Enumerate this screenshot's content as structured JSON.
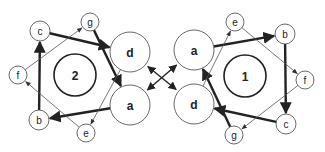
{
  "diagram": {
    "colors": {
      "stroke": "#333333",
      "fill": "#ffffff",
      "text": "#222222"
    },
    "graphs": [
      {
        "id": "graph-2",
        "label": "2",
        "center": {
          "x": 75,
          "y": 75,
          "r": 21
        },
        "nodes": [
          {
            "id": "c",
            "label": "c",
            "x": 40,
            "y": 31,
            "r": 10
          },
          {
            "id": "g",
            "label": "g",
            "x": 90,
            "y": 22,
            "r": 9
          },
          {
            "id": "d",
            "label": "d",
            "x": 130,
            "y": 52,
            "r": 20
          },
          {
            "id": "a",
            "label": "a",
            "x": 130,
            "y": 105,
            "r": 20
          },
          {
            "id": "e",
            "label": "e",
            "x": 86,
            "y": 133,
            "r": 9
          },
          {
            "id": "b",
            "label": "b",
            "x": 39,
            "y": 120,
            "r": 10
          },
          {
            "id": "f",
            "label": "f",
            "x": 18,
            "y": 75,
            "r": 9
          }
        ],
        "edges": [
          {
            "from": "c",
            "to": "d",
            "weight": "thick"
          },
          {
            "from": "g",
            "to": "a",
            "weight": "thick"
          },
          {
            "from": "a",
            "to": "b",
            "weight": "thick"
          },
          {
            "from": "b",
            "to": "c",
            "weight": "thick"
          },
          {
            "from": "f",
            "to": "g",
            "weight": "thin"
          },
          {
            "from": "e",
            "to": "f",
            "weight": "thin"
          },
          {
            "from": "d",
            "to": "e",
            "weight": "thin"
          }
        ]
      },
      {
        "id": "graph-1",
        "label": "1",
        "center": {
          "x": 245,
          "y": 76,
          "r": 21
        },
        "nodes": [
          {
            "id": "a",
            "label": "a",
            "x": 194,
            "y": 50,
            "r": 20
          },
          {
            "id": "e",
            "label": "e",
            "x": 235,
            "y": 22,
            "r": 9
          },
          {
            "id": "b",
            "label": "b",
            "x": 285,
            "y": 34,
            "r": 10
          },
          {
            "id": "f",
            "label": "f",
            "x": 305,
            "y": 80,
            "r": 9
          },
          {
            "id": "c",
            "label": "c",
            "x": 286,
            "y": 124,
            "r": 10
          },
          {
            "id": "g",
            "label": "g",
            "x": 234,
            "y": 135,
            "r": 9
          },
          {
            "id": "d",
            "label": "d",
            "x": 194,
            "y": 104,
            "r": 20
          }
        ],
        "edges": [
          {
            "from": "a",
            "to": "b",
            "weight": "thick"
          },
          {
            "from": "b",
            "to": "c",
            "weight": "thick"
          },
          {
            "from": "c",
            "to": "d",
            "weight": "thick"
          },
          {
            "from": "g",
            "to": "a",
            "weight": "thick"
          },
          {
            "from": "e",
            "to": "f",
            "weight": "thin"
          },
          {
            "from": "f",
            "to": "g",
            "weight": "thin"
          },
          {
            "from": "d",
            "to": "e",
            "weight": "thin"
          }
        ]
      }
    ],
    "cross_links": [
      {
        "from": "graph-2.d",
        "to": "graph-1.d",
        "bidirectional": true
      },
      {
        "from": "graph-2.a",
        "to": "graph-1.a",
        "bidirectional": true
      }
    ]
  }
}
